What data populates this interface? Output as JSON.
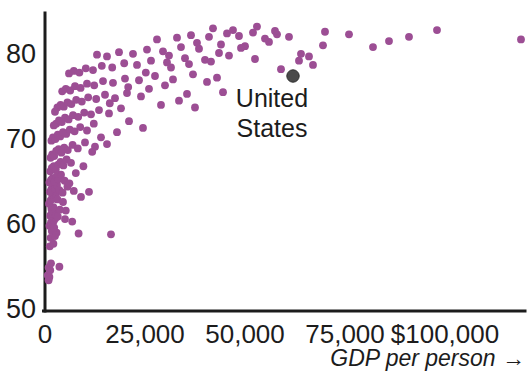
{
  "chart_data": {
    "type": "scatter",
    "title": "",
    "xlabel": "GDP per person →",
    "ylabel": "",
    "xlim": [
      0,
      120000
    ],
    "ylim": [
      50,
      85
    ],
    "grid": false,
    "legend": null,
    "x_ticks": [
      {
        "value": 0,
        "label": "0"
      },
      {
        "value": 25000,
        "label": "25,000"
      },
      {
        "value": 50000,
        "label": "50,000"
      },
      {
        "value": 75000,
        "label": "75,000"
      },
      {
        "value": 100000,
        "label": "$100,000"
      }
    ],
    "y_ticks": [
      {
        "value": 50,
        "label": "50"
      },
      {
        "value": 60,
        "label": "60"
      },
      {
        "value": 70,
        "label": "70"
      },
      {
        "value": 80,
        "label": "80"
      }
    ],
    "marker_color": "#9c4e94",
    "highlight_color": "#4a4a4a",
    "axis_color": "#1c1c1c",
    "annotations": [
      {
        "text": "United States",
        "x": 62000,
        "y": 77.5,
        "lines": [
          "United",
          "States"
        ]
      }
    ],
    "series": [
      {
        "name": "Countries",
        "color": "#9c4e94",
        "points": [
          [
            700,
            54.2
          ],
          [
            900,
            53.6
          ],
          [
            1100,
            54.0
          ],
          [
            1300,
            54.8
          ],
          [
            900,
            55.1
          ],
          [
            1500,
            55.6
          ],
          [
            3600,
            55.2
          ],
          [
            1200,
            57.6
          ],
          [
            2100,
            57.9
          ],
          [
            1400,
            58.6
          ],
          [
            2500,
            58.8
          ],
          [
            1700,
            59.4
          ],
          [
            2900,
            59.2
          ],
          [
            1100,
            60.0
          ],
          [
            1500,
            60.4
          ],
          [
            1900,
            60.2
          ],
          [
            2200,
            60.6
          ],
          [
            2600,
            60.9
          ],
          [
            1300,
            61.2
          ],
          [
            1700,
            61.5
          ],
          [
            2000,
            61.4
          ],
          [
            2400,
            61.6
          ],
          [
            2800,
            61.3
          ],
          [
            1600,
            62.0
          ],
          [
            2100,
            62.2
          ],
          [
            3200,
            61.1
          ],
          [
            5200,
            61.8
          ],
          [
            6800,
            60.5
          ],
          [
            8400,
            59.1
          ],
          [
            16500,
            59.0
          ],
          [
            1000,
            62.6
          ],
          [
            1400,
            63.0
          ],
          [
            1800,
            63.4
          ],
          [
            2300,
            63.2
          ],
          [
            2700,
            63.6
          ],
          [
            3100,
            63.1
          ],
          [
            1200,
            64.0
          ],
          [
            1600,
            64.3
          ],
          [
            2000,
            64.6
          ],
          [
            2500,
            64.4
          ],
          [
            3000,
            64.8
          ],
          [
            3600,
            64.2
          ],
          [
            4400,
            63.9
          ],
          [
            5600,
            64.6
          ],
          [
            7200,
            64.1
          ],
          [
            9000,
            63.4
          ],
          [
            11000,
            64.0
          ],
          [
            1100,
            65.1
          ],
          [
            1500,
            65.4
          ],
          [
            1900,
            65.6
          ],
          [
            2400,
            65.2
          ],
          [
            2900,
            65.8
          ],
          [
            3400,
            65.5
          ],
          [
            4000,
            66.0
          ],
          [
            4900,
            65.3
          ],
          [
            1300,
            66.4
          ],
          [
            1700,
            66.8
          ],
          [
            2200,
            67.0
          ],
          [
            2700,
            66.6
          ],
          [
            3300,
            67.2
          ],
          [
            3900,
            67.5
          ],
          [
            4600,
            67.1
          ],
          [
            5400,
            67.8
          ],
          [
            6500,
            67.4
          ],
          [
            1400,
            68.0
          ],
          [
            1800,
            68.4
          ],
          [
            2300,
            68.2
          ],
          [
            2800,
            68.8
          ],
          [
            3400,
            69.0
          ],
          [
            4100,
            68.6
          ],
          [
            4800,
            69.2
          ],
          [
            5700,
            68.9
          ],
          [
            6900,
            69.5
          ],
          [
            8200,
            69.1
          ],
          [
            10000,
            69.8
          ],
          [
            12500,
            69.3
          ],
          [
            15500,
            69.6
          ],
          [
            1600,
            70.0
          ],
          [
            2000,
            70.4
          ],
          [
            2600,
            70.2
          ],
          [
            3200,
            70.7
          ],
          [
            3800,
            70.5
          ],
          [
            4500,
            71.0
          ],
          [
            5300,
            70.8
          ],
          [
            6200,
            71.3
          ],
          [
            7400,
            71.1
          ],
          [
            8800,
            71.6
          ],
          [
            10500,
            71.2
          ],
          [
            2200,
            71.8
          ],
          [
            2800,
            72.0
          ],
          [
            3500,
            72.4
          ],
          [
            4200,
            72.2
          ],
          [
            5000,
            72.7
          ],
          [
            5900,
            72.5
          ],
          [
            7000,
            73.0
          ],
          [
            8300,
            72.8
          ],
          [
            9800,
            73.3
          ],
          [
            11500,
            73.1
          ],
          [
            13500,
            73.6
          ],
          [
            16000,
            73.2
          ],
          [
            19000,
            73.8
          ],
          [
            2500,
            73.4
          ],
          [
            3100,
            73.9
          ],
          [
            3900,
            74.2
          ],
          [
            4700,
            74.0
          ],
          [
            5600,
            74.5
          ],
          [
            6600,
            74.3
          ],
          [
            7800,
            74.8
          ],
          [
            9200,
            74.6
          ],
          [
            10800,
            75.1
          ],
          [
            12800,
            74.9
          ],
          [
            15000,
            75.4
          ],
          [
            17500,
            75.0
          ],
          [
            20500,
            75.6
          ],
          [
            24000,
            75.2
          ],
          [
            4300,
            75.8
          ],
          [
            5200,
            76.1
          ],
          [
            6300,
            75.9
          ],
          [
            7500,
            76.4
          ],
          [
            8900,
            76.2
          ],
          [
            10500,
            76.7
          ],
          [
            12300,
            76.5
          ],
          [
            14500,
            77.0
          ],
          [
            17000,
            76.8
          ],
          [
            20000,
            77.3
          ],
          [
            23500,
            77.1
          ],
          [
            27500,
            77.6
          ],
          [
            32000,
            77.2
          ],
          [
            37000,
            77.8
          ],
          [
            43000,
            77.4
          ],
          [
            6000,
            77.9
          ],
          [
            7200,
            78.2
          ],
          [
            8600,
            78.0
          ],
          [
            10200,
            78.5
          ],
          [
            12000,
            78.3
          ],
          [
            14200,
            78.8
          ],
          [
            16800,
            78.6
          ],
          [
            19800,
            79.1
          ],
          [
            23000,
            78.9
          ],
          [
            26500,
            79.4
          ],
          [
            30500,
            79.2
          ],
          [
            35000,
            79.7
          ],
          [
            40000,
            79.5
          ],
          [
            46000,
            80.0
          ],
          [
            13000,
            80.1
          ],
          [
            15500,
            79.9
          ],
          [
            18500,
            80.4
          ],
          [
            22000,
            80.2
          ],
          [
            25500,
            80.7
          ],
          [
            29500,
            80.5
          ],
          [
            34000,
            81.0
          ],
          [
            38500,
            80.8
          ],
          [
            44000,
            81.3
          ],
          [
            50000,
            81.1
          ],
          [
            56000,
            81.6
          ],
          [
            28000,
            81.9
          ],
          [
            33000,
            82.1
          ],
          [
            36500,
            82.4
          ],
          [
            41000,
            82.2
          ],
          [
            45500,
            82.6
          ],
          [
            48500,
            82.3
          ],
          [
            52000,
            82.7
          ],
          [
            55000,
            82.0
          ],
          [
            58000,
            82.5
          ],
          [
            61000,
            82.2
          ],
          [
            42000,
            83.2
          ],
          [
            47000,
            83.0
          ],
          [
            53000,
            83.4
          ],
          [
            57500,
            82.9
          ],
          [
            49000,
            80.9
          ],
          [
            43500,
            80.3
          ],
          [
            38000,
            81.5
          ],
          [
            31000,
            80.0
          ],
          [
            26000,
            76.1
          ],
          [
            30000,
            76.5
          ],
          [
            35500,
            75.5
          ],
          [
            40500,
            76.9
          ],
          [
            44500,
            75.7
          ],
          [
            52500,
            79.6
          ],
          [
            59000,
            78.4
          ],
          [
            64000,
            80.2
          ],
          [
            67000,
            78.9
          ],
          [
            70000,
            82.8
          ],
          [
            76000,
            82.5
          ],
          [
            82000,
            81.0
          ],
          [
            86000,
            81.7
          ],
          [
            91000,
            82.2
          ],
          [
            98000,
            83.0
          ],
          [
            119000,
            81.9
          ],
          [
            63500,
            79.4
          ],
          [
            66000,
            79.9
          ],
          [
            69500,
            81.2
          ],
          [
            29000,
            74.2
          ],
          [
            33500,
            74.7
          ],
          [
            37500,
            73.9
          ],
          [
            21000,
            72.3
          ],
          [
            24500,
            71.5
          ],
          [
            18000,
            71.0
          ],
          [
            14000,
            70.4
          ],
          [
            11800,
            68.7
          ],
          [
            9600,
            67.0
          ],
          [
            7700,
            66.2
          ],
          [
            6100,
            65.0
          ],
          [
            4500,
            62.8
          ],
          [
            3700,
            61.9
          ],
          [
            5000,
            60.8
          ],
          [
            2300,
            59.8
          ],
          [
            12200,
            72.0
          ],
          [
            16200,
            74.4
          ],
          [
            20800,
            76.3
          ],
          [
            25200,
            78.0
          ],
          [
            31500,
            78.6
          ],
          [
            36000,
            79.0
          ],
          [
            41500,
            79.3
          ]
        ]
      },
      {
        "name": "United States",
        "color": "#4a4a4a",
        "points": [
          [
            62000,
            77.6
          ]
        ]
      }
    ]
  }
}
